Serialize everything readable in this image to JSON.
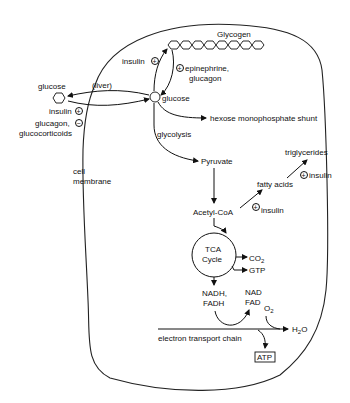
{
  "diagram": {
    "membrane_label": [
      "cell",
      "membrane"
    ],
    "nodes": {
      "glycogen": "Glycogen",
      "glucose_out": "glucose",
      "liver": "(liver)",
      "glucose_in": "glucose",
      "hms": "hexose monophosphate shunt",
      "glycolysis": "glycolysis",
      "pyruvate": "Pyruvate",
      "acetyl_coa": "Acetyl-CoA",
      "fatty_acids": "fatty acids",
      "triglycerides": "triglycerides",
      "tca_line1": "TCA",
      "tca_line2": "Cycle",
      "co2": "CO",
      "co2_sub": "2",
      "gtp": "GTP",
      "nadh_line1": "NADH,",
      "nadh_line2": "FADH",
      "nad_line1": "NAD",
      "nad_line2": "FAD",
      "o2": "O",
      "o2_sub": "2",
      "h2o_pre": "H",
      "h2o_sub": "2",
      "h2o_post": "O",
      "etc": "electron transport chain",
      "atp": "ATP"
    },
    "regulators": {
      "insulin_glycogen": "insulin",
      "epinephrine_line1": "epinephrine,",
      "epinephrine_line2": "glucagon",
      "insulin_uptake": "insulin",
      "glucagon_line1": "glucagon,",
      "glucagon_line2": "glucocorticoids",
      "insulin_acetyl": "insulin",
      "insulin_fatty": "insulin"
    },
    "signs": {
      "plus": "+",
      "minus": "−"
    },
    "colors": {
      "ink": "#111111",
      "background": "#ffffff"
    }
  }
}
